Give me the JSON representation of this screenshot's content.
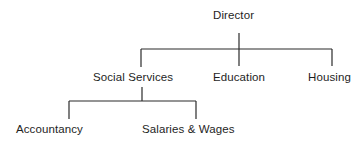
{
  "diagram": {
    "type": "org-chart",
    "nodes": {
      "director": "Director",
      "social_services": "Social Services",
      "education": "Education",
      "housing": "Housing",
      "accountancy": "Accountancy",
      "salaries_wages": "Salaries & Wages"
    },
    "edges": [
      [
        "Director",
        "Social Services"
      ],
      [
        "Director",
        "Education"
      ],
      [
        "Director",
        "Housing"
      ],
      [
        "Social Services",
        "Accountancy"
      ],
      [
        "Social Services",
        "Salaries & Wages"
      ]
    ],
    "colors": {
      "text": "#1e1e1e",
      "lines": "#2a2a2a",
      "background": "#ffffff"
    }
  }
}
